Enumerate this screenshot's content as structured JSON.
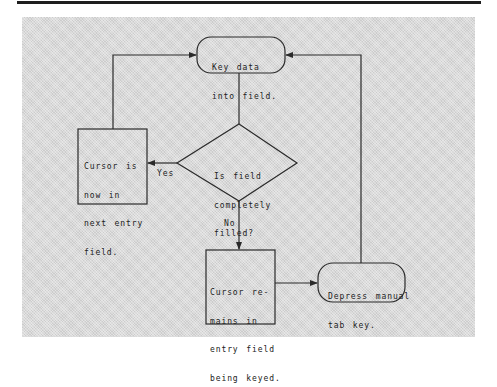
{
  "diagram": {
    "type": "flowchart",
    "nodes": {
      "start": {
        "shape": "terminal",
        "lines": [
          "Key data",
          "into field."
        ]
      },
      "decision": {
        "shape": "diamond",
        "lines": [
          "Is field",
          "completely",
          "filled?"
        ]
      },
      "cursor_next": {
        "shape": "process",
        "lines": [
          "Cursor is",
          "now in",
          "next entry",
          "field."
        ]
      },
      "cursor_remains": {
        "shape": "process",
        "lines": [
          "Cursor re-",
          "mains in",
          "entry field",
          "being keyed."
        ]
      },
      "depress_tab": {
        "shape": "terminal",
        "lines": [
          "Depress manual",
          "tab key."
        ]
      }
    },
    "edge_labels": {
      "yes": "Yes",
      "no": "No"
    },
    "edges": [
      {
        "from": "start",
        "to": "decision"
      },
      {
        "from": "decision",
        "to": "cursor_next",
        "label": "Yes"
      },
      {
        "from": "decision",
        "to": "cursor_remains",
        "label": "No"
      },
      {
        "from": "cursor_next",
        "to": "start"
      },
      {
        "from": "cursor_remains",
        "to": "depress_tab"
      },
      {
        "from": "depress_tab",
        "to": "start"
      }
    ]
  },
  "colors": {
    "line": "#2a2a2a",
    "panel": "#d9d9d9",
    "rule": "#1e1e1e",
    "background": "#ffffff"
  }
}
